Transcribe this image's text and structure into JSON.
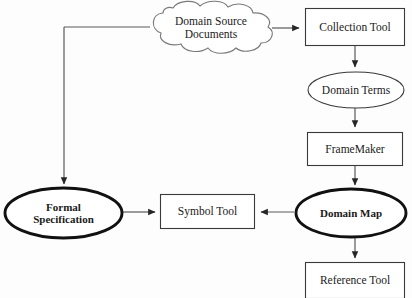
{
  "diagram": {
    "background_color": "#fdfdfd",
    "stroke_color": "#262626",
    "text_color": "#1a1a1a",
    "nodes": [
      {
        "id": "domain-source-documents",
        "label": "Domain Source\nDocuments",
        "shape": "cloud",
        "bold": false,
        "x": 150,
        "y": 4,
        "w": 122,
        "h": 47
      },
      {
        "id": "collection-tool",
        "label": "Collection Tool",
        "shape": "rectangle",
        "bold": false,
        "x": 305,
        "y": 8,
        "w": 100,
        "h": 38
      },
      {
        "id": "domain-terms",
        "label": "Domain Terms",
        "shape": "ellipse",
        "bold": false,
        "x": 308,
        "y": 72,
        "w": 96,
        "h": 36
      },
      {
        "id": "framemaker",
        "label": "FrameMaker",
        "shape": "rectangle",
        "bold": false,
        "x": 307,
        "y": 132,
        "w": 96,
        "h": 34
      },
      {
        "id": "domain-map",
        "label": "Domain Map",
        "shape": "ellipse-thick",
        "bold": true,
        "x": 296,
        "y": 189,
        "w": 110,
        "h": 48
      },
      {
        "id": "reference-tool",
        "label": "Reference Tool",
        "shape": "rectangle",
        "bold": false,
        "x": 305,
        "y": 262,
        "w": 100,
        "h": 36
      },
      {
        "id": "symbol-tool",
        "label": "Symbol Tool",
        "shape": "rectangle",
        "bold": false,
        "x": 160,
        "y": 194,
        "w": 95,
        "h": 35
      },
      {
        "id": "formal-specification",
        "label": "Formal\nSpecification",
        "shape": "ellipse-thick",
        "bold": true,
        "x": 5,
        "y": 188,
        "w": 117,
        "h": 50
      }
    ],
    "edges": [
      {
        "id": "edge-docs-to-collection",
        "from": "domain-source-documents",
        "to": "collection-tool",
        "label": ""
      },
      {
        "id": "edge-docs-to-formal-spec",
        "from": "domain-source-documents",
        "to": "formal-specification",
        "label": ""
      },
      {
        "id": "edge-collection-to-terms",
        "from": "collection-tool",
        "to": "domain-terms",
        "label": ""
      },
      {
        "id": "edge-terms-to-framemaker",
        "from": "domain-terms",
        "to": "framemaker",
        "label": ""
      },
      {
        "id": "edge-framemaker-to-map",
        "from": "framemaker",
        "to": "domain-map",
        "label": ""
      },
      {
        "id": "edge-map-to-reference",
        "from": "domain-map",
        "to": "reference-tool",
        "label": ""
      },
      {
        "id": "edge-map-to-symbol",
        "from": "domain-map",
        "to": "symbol-tool",
        "label": ""
      },
      {
        "id": "edge-formal-spec-to-symbol",
        "from": "formal-specification",
        "to": "symbol-tool",
        "label": ""
      }
    ]
  }
}
